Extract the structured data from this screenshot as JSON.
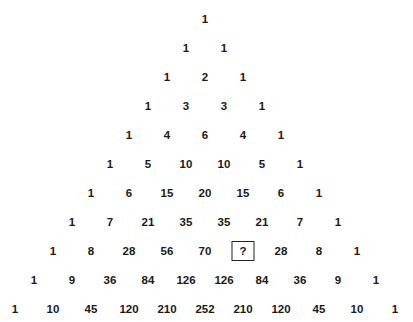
{
  "rows": [
    [
      "1"
    ],
    [
      "1",
      "1"
    ],
    [
      "1",
      "2",
      "1"
    ],
    [
      "1",
      "3",
      "3",
      "1"
    ],
    [
      "1",
      "4",
      "6",
      "4",
      "1"
    ],
    [
      "1",
      "5",
      "10",
      "10",
      "5",
      "1"
    ],
    [
      "1",
      "6",
      "15",
      "20",
      "15",
      "6",
      "1"
    ],
    [
      "1",
      "7",
      "21",
      "35",
      "35",
      "21",
      "7",
      "1"
    ],
    [
      "1",
      "8",
      "28",
      "56",
      "70",
      "?",
      "28",
      "8",
      "1"
    ],
    [
      "1",
      "9",
      "36",
      "84",
      "126",
      "126",
      "84",
      "36",
      "9",
      "1"
    ],
    [
      "1",
      "10",
      "45",
      "120",
      "210",
      "252",
      "210",
      "120",
      "45",
      "10",
      "1"
    ]
  ],
  "unknown": {
    "row": 8,
    "index": 5,
    "label": "?"
  },
  "layout": {
    "center_x": 205,
    "top_y": 19,
    "row_spacing": 29,
    "col_spacing": 38
  }
}
